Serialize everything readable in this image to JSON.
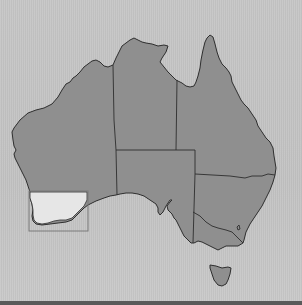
{
  "map": {
    "title": "Map of Australia",
    "highlighted_region": "South West Western Australia",
    "colors": {
      "background": "#c4c4c4",
      "land": "#8f8f8f",
      "border": "#2e2e2e",
      "highlight_fill": "#e6e6e6",
      "highlight_box": "#7a7a7a",
      "bottom_bar": "#5a5a5a"
    },
    "regions": [
      {
        "id": "wa",
        "name": "Western Australia"
      },
      {
        "id": "nt",
        "name": "Northern Territory"
      },
      {
        "id": "sa",
        "name": "South Australia"
      },
      {
        "id": "qld",
        "name": "Queensland"
      },
      {
        "id": "nsw",
        "name": "New South Wales"
      },
      {
        "id": "vic",
        "name": "Victoria"
      },
      {
        "id": "act",
        "name": "Australian Capital Territory"
      },
      {
        "id": "tas",
        "name": "Tasmania"
      }
    ]
  }
}
